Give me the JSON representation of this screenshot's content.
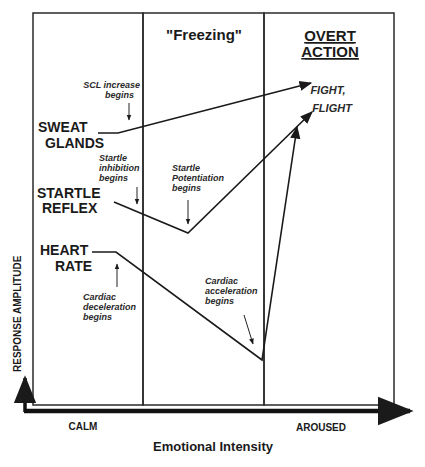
{
  "zones": {
    "calm_zone": {
      "shaded": true
    },
    "freezing_zone": {
      "label": "\"Freezing\"",
      "shaded": false
    },
    "action_zone": {
      "label_line1": "OVERT",
      "label_line2": "ACTION",
      "shaded": true
    }
  },
  "outcome": {
    "line1": "FIGHT,",
    "line2": "FLIGHT"
  },
  "responses": {
    "sweat": {
      "line1": "SWEAT",
      "line2": "GLANDS"
    },
    "startle": {
      "line1": "STARTLE",
      "line2": "REFLEX"
    },
    "heart": {
      "line1": "HEART",
      "line2": "RATE"
    }
  },
  "annotations": {
    "scl": {
      "line1": "SCL increase",
      "line2": "begins"
    },
    "startle_inhibition": {
      "line1": "Startle",
      "line2": "inhibition",
      "line3": "begins"
    },
    "startle_potentiation": {
      "line1": "Startle",
      "line2": "Potentiation",
      "line3": "begins"
    },
    "cardiac_deceleration": {
      "line1": "Cardiac",
      "line2": "deceleration",
      "line3": "begins"
    },
    "cardiac_acceleration": {
      "line1": "Cardiac",
      "line2": "acceleration",
      "line3": "begins"
    }
  },
  "axes": {
    "y_label": "RESPONSE AMPLITUDE",
    "x_label": "Emotional Intensity",
    "x_left": "CALM",
    "x_right": "AROUSED"
  },
  "colors": {
    "ink": "#1a1a1a",
    "dot": "#9a9a9a",
    "background": "#ffffff"
  }
}
